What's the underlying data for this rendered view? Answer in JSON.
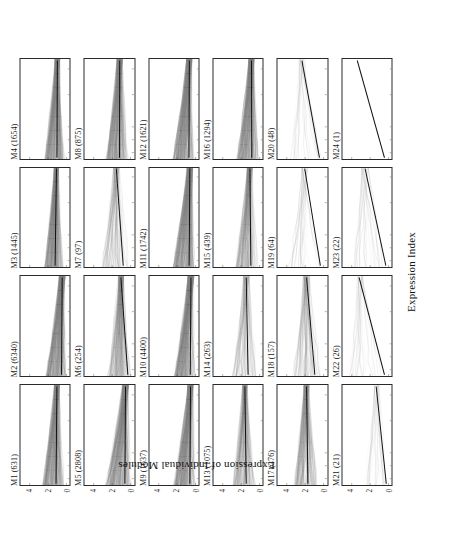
{
  "figure": {
    "xlabel": "Expression Index",
    "ylabel": "Expression of Individual Modules"
  },
  "chart_data": {
    "type": "line",
    "title": "",
    "xlabel": "Expression Index",
    "ylabel": "Expression of Individual Modules",
    "grid": false,
    "legend": null,
    "x_scale": "log10",
    "xlim": [
      3.3,
      4.85
    ],
    "ylim": [
      -0.35,
      5.0
    ],
    "x_tick_labels": [
      "10^3.4",
      "10^3.6",
      "10^3.8",
      "10^4.3",
      "10^4.7"
    ],
    "x_tick_values": [
      3.4,
      3.6,
      3.8,
      4.3,
      4.7
    ],
    "y_tick_labels": [
      "0",
      "2",
      "4"
    ],
    "y_tick_values": [
      0,
      2,
      4
    ],
    "panel_grid": {
      "rows": 6,
      "cols": 4
    },
    "panels": [
      {
        "id": "M1",
        "label": "M1 (631)",
        "n_genes": 631,
        "fit_y_start": 1.15,
        "fit_y_end": 1.05,
        "band_lo": 0.3,
        "band_hi": 2.55,
        "density": "very-high",
        "fan": "left-heavy",
        "spread": 1.05
      },
      {
        "id": "M2",
        "label": "M2 (6340)",
        "n_genes": 6340,
        "fit_y_start": 0.55,
        "fit_y_end": 0.48,
        "band_lo": 0.05,
        "band_hi": 2.2,
        "density": "very-high",
        "fan": "left-heavy",
        "spread": 1.2
      },
      {
        "id": "M3",
        "label": "M3 (1445)",
        "n_genes": 1445,
        "fit_y_start": 1.25,
        "fit_y_end": 1.1,
        "band_lo": 0.4,
        "band_hi": 2.35,
        "density": "very-high",
        "fan": "left-heavy",
        "spread": 0.9
      },
      {
        "id": "M4",
        "label": "M4 (1654)",
        "n_genes": 1654,
        "fit_y_start": 1.05,
        "fit_y_end": 1.0,
        "band_lo": 0.25,
        "band_hi": 2.3,
        "density": "very-high",
        "fan": "left-heavy",
        "spread": 1.0
      },
      {
        "id": "M5",
        "label": "M5 (2808)",
        "n_genes": 2808,
        "fit_y_start": 0.62,
        "fit_y_end": 0.55,
        "band_lo": 0.05,
        "band_hi": 2.6,
        "density": "very-high",
        "fan": "left-heavy",
        "spread": 1.25
      },
      {
        "id": "M6",
        "label": "M6 (254)",
        "n_genes": 254,
        "fit_y_start": 0.3,
        "fit_y_end": 1.05,
        "band_lo": 0.05,
        "band_hi": 2.4,
        "density": "high",
        "fan": "left-heavy",
        "spread": 1.1
      },
      {
        "id": "M7",
        "label": "M7 (97)",
        "n_genes": 97,
        "fit_y_start": 0.8,
        "fit_y_end": 1.55,
        "band_lo": 0.1,
        "band_hi": 3.1,
        "density": "medium",
        "fan": "left-heavy",
        "spread": 1.3
      },
      {
        "id": "M8",
        "label": "M8 (875)",
        "n_genes": 875,
        "fit_y_start": 1.2,
        "fit_y_end": 1.18,
        "band_lo": 0.3,
        "band_hi": 2.6,
        "density": "very-high",
        "fan": "left-heavy",
        "spread": 1.1
      },
      {
        "id": "M9",
        "label": "M9 (1637)",
        "n_genes": 1637,
        "fit_y_start": 0.62,
        "fit_y_end": 0.55,
        "band_lo": 0.05,
        "band_hi": 2.3,
        "density": "very-high",
        "fan": "left-heavy",
        "spread": 1.15
      },
      {
        "id": "M10",
        "label": "M10 (4400)",
        "n_genes": 4400,
        "fit_y_start": 0.58,
        "fit_y_end": 0.5,
        "band_lo": 0.05,
        "band_hi": 2.25,
        "density": "very-high",
        "fan": "left-heavy",
        "spread": 1.18
      },
      {
        "id": "M11",
        "label": "M11 (1742)",
        "n_genes": 1742,
        "fit_y_start": 0.7,
        "fit_y_end": 0.62,
        "band_lo": 0.1,
        "band_hi": 2.4,
        "density": "very-high",
        "fan": "left-heavy",
        "spread": 1.12
      },
      {
        "id": "M12",
        "label": "M12 (1621)",
        "n_genes": 1621,
        "fit_y_start": 0.72,
        "fit_y_end": 0.68,
        "band_lo": 0.1,
        "band_hi": 2.45,
        "density": "very-high",
        "fan": "left-heavy",
        "spread": 1.12
      },
      {
        "id": "M13",
        "label": "M13 (1075)",
        "n_genes": 1075,
        "fit_y_start": 1.45,
        "fit_y_end": 1.6,
        "band_lo": 0.45,
        "band_hi": 2.9,
        "density": "high",
        "fan": "left-heavy",
        "spread": 1.0
      },
      {
        "id": "M14",
        "label": "M14 (263)",
        "n_genes": 263,
        "fit_y_start": 1.25,
        "fit_y_end": 1.45,
        "band_lo": 0.3,
        "band_hi": 2.95,
        "density": "medium",
        "fan": "left-heavy",
        "spread": 1.2
      },
      {
        "id": "M15",
        "label": "M15 (439)",
        "n_genes": 439,
        "fit_y_start": 0.95,
        "fit_y_end": 1.05,
        "band_lo": 0.2,
        "band_hi": 2.55,
        "density": "high",
        "fan": "left-heavy",
        "spread": 1.1
      },
      {
        "id": "M16",
        "label": "M16 (1294)",
        "n_genes": 1294,
        "fit_y_start": 0.85,
        "fit_y_end": 0.88,
        "band_lo": 0.15,
        "band_hi": 2.4,
        "density": "very-high",
        "fan": "left-heavy",
        "spread": 1.08
      },
      {
        "id": "M17",
        "label": "M17 (376)",
        "n_genes": 376,
        "fit_y_start": 1.7,
        "fit_y_end": 1.85,
        "band_lo": 0.55,
        "band_hi": 3.2,
        "density": "high",
        "fan": "left-heavy",
        "spread": 1.05
      },
      {
        "id": "M18",
        "label": "M18 (157)",
        "n_genes": 157,
        "fit_y_start": 0.95,
        "fit_y_end": 1.85,
        "band_lo": 0.15,
        "band_hi": 3.35,
        "density": "medium",
        "fan": "left-heavy",
        "spread": 1.35
      },
      {
        "id": "M19",
        "label": "M19 (64)",
        "n_genes": 64,
        "fit_y_start": 0.35,
        "fit_y_end": 2.05,
        "band_lo": 0.05,
        "band_hi": 3.8,
        "density": "low",
        "fan": "left-heavy",
        "spread": 1.5
      },
      {
        "id": "M20",
        "label": "M20 (48)",
        "n_genes": 48,
        "fit_y_start": 0.45,
        "fit_y_end": 2.35,
        "band_lo": 0.05,
        "band_hi": 3.6,
        "density": "low",
        "fan": "left-heavy",
        "spread": 1.45
      },
      {
        "id": "M21",
        "label": "M21 (21)",
        "n_genes": 21,
        "fit_y_start": 0.25,
        "fit_y_end": 1.35,
        "band_lo": 0.02,
        "band_hi": 2.7,
        "density": "low",
        "fan": "left-heavy",
        "spread": 1.3
      },
      {
        "id": "M22",
        "label": "M22 (26)",
        "n_genes": 26,
        "fit_y_start": 0.45,
        "fit_y_end": 3.2,
        "band_lo": 0.05,
        "band_hi": 4.1,
        "density": "low",
        "fan": "left-heavy",
        "spread": 1.55
      },
      {
        "id": "M23",
        "label": "M23 (22)",
        "n_genes": 22,
        "fit_y_start": 0.3,
        "fit_y_end": 2.55,
        "band_lo": 0.02,
        "band_hi": 3.9,
        "density": "low",
        "fan": "left-heavy",
        "spread": 1.5
      },
      {
        "id": "M24",
        "label": "M24 (1)",
        "n_genes": 1,
        "fit_y_start": 0.45,
        "fit_y_end": 3.4,
        "band_lo": 0.45,
        "band_hi": 3.4,
        "density": "none",
        "fan": "none",
        "spread": 0.0
      }
    ]
  }
}
